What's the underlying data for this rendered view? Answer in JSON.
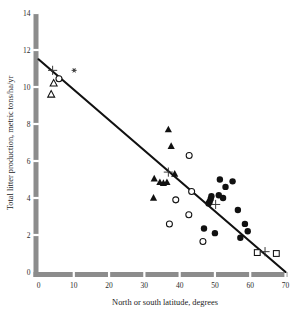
{
  "chart_data": {
    "type": "scatter",
    "title": "",
    "xlabel": "North or south latitude, degrees",
    "ylabel": "Total litter production, metric tons/ha/yr",
    "xlim": [
      0,
      70
    ],
    "ylim": [
      0,
      14
    ],
    "xticks": [
      0,
      10,
      20,
      30,
      40,
      50,
      60,
      70
    ],
    "xtick_labels": [
      "0",
      "10",
      "20",
      "30",
      "40",
      "50",
      "60",
      "70"
    ],
    "yticks": [
      0,
      2,
      4,
      6,
      8,
      10,
      12,
      14
    ],
    "ytick_labels": [
      "0",
      "2",
      "4",
      "6",
      "8",
      "10",
      "12",
      "14"
    ],
    "grid": false,
    "legend": "none",
    "series": [
      {
        "name": "open-triangle",
        "marker": "triangle-open",
        "points": [
          {
            "x": 4.3,
            "y": 10.2
          },
          {
            "x": 3.6,
            "y": 9.6
          }
        ]
      },
      {
        "name": "open-circle-low-latitude",
        "marker": "circle-open",
        "points": [
          {
            "x": 5.8,
            "y": 10.45
          }
        ]
      },
      {
        "name": "filled-triangle",
        "marker": "triangle-filled",
        "points": [
          {
            "x": 36.8,
            "y": 7.7
          },
          {
            "x": 37.6,
            "y": 6.8
          },
          {
            "x": 32.8,
            "y": 5.05
          },
          {
            "x": 34.4,
            "y": 4.85
          },
          {
            "x": 35.4,
            "y": 4.8
          },
          {
            "x": 36.4,
            "y": 4.85
          },
          {
            "x": 32.6,
            "y": 4.0
          },
          {
            "x": 38.6,
            "y": 5.3
          }
        ]
      },
      {
        "name": "open-circle",
        "marker": "circle-open",
        "points": [
          {
            "x": 42.7,
            "y": 6.3
          },
          {
            "x": 43.4,
            "y": 4.35
          },
          {
            "x": 38.9,
            "y": 3.9
          },
          {
            "x": 42.6,
            "y": 3.1
          },
          {
            "x": 37.1,
            "y": 2.6
          },
          {
            "x": 46.6,
            "y": 1.65
          }
        ]
      },
      {
        "name": "filled-circle",
        "marker": "circle-filled",
        "points": [
          {
            "x": 51.4,
            "y": 5.0
          },
          {
            "x": 55.0,
            "y": 4.9
          },
          {
            "x": 53.0,
            "y": 4.6
          },
          {
            "x": 51.1,
            "y": 4.15
          },
          {
            "x": 52.3,
            "y": 4.0
          },
          {
            "x": 49.0,
            "y": 4.1
          },
          {
            "x": 48.8,
            "y": 3.95
          },
          {
            "x": 48.5,
            "y": 3.8
          },
          {
            "x": 48.2,
            "y": 3.7
          },
          {
            "x": 56.5,
            "y": 3.35
          },
          {
            "x": 58.5,
            "y": 2.6
          },
          {
            "x": 59.3,
            "y": 2.2
          },
          {
            "x": 57.2,
            "y": 1.85
          },
          {
            "x": 46.9,
            "y": 2.35
          },
          {
            "x": 50.0,
            "y": 2.1
          }
        ]
      },
      {
        "name": "open-square",
        "marker": "square-open",
        "points": [
          {
            "x": 62.0,
            "y": 1.05
          },
          {
            "x": 67.4,
            "y": 1.0
          }
        ]
      },
      {
        "name": "plus-marker",
        "marker": "plus",
        "points": [
          {
            "x": 4.0,
            "y": 10.9
          },
          {
            "x": 36.8,
            "y": 5.4
          },
          {
            "x": 50.2,
            "y": 3.65
          },
          {
            "x": 64.2,
            "y": 1.1
          }
        ]
      },
      {
        "name": "asterisk-marker",
        "marker": "asterisk",
        "points": [
          {
            "x": 10.1,
            "y": 10.9
          }
        ]
      }
    ],
    "fit_line": {
      "name": "regression-line",
      "x_start": 0,
      "y_start": 11.5,
      "x_end": 70,
      "y_end": 0
    }
  }
}
